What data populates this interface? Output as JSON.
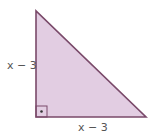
{
  "diagram": {
    "type": "right-triangle",
    "colors": {
      "fill": "#e2cde2",
      "stroke": "#7a4a6a",
      "label": "#555555"
    },
    "vertices": {
      "top": [
        36,
        11
      ],
      "right_angle": [
        36,
        117
      ],
      "right": [
        146,
        117
      ]
    },
    "labels": {
      "vertical_leg": "x − 3",
      "horizontal_leg": "x − 3"
    },
    "right_angle_marker": {
      "size": 11,
      "has_dot": true
    }
  }
}
